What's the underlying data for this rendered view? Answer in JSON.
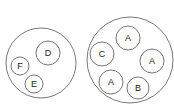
{
  "groups": [
    {
      "name": "left-group",
      "circle": {
        "cx": 41,
        "cy": 63,
        "r": 35
      },
      "items": [
        {
          "label": "D",
          "cx": 48,
          "cy": 53,
          "r": 12
        },
        {
          "label": "F",
          "cx": 20,
          "cy": 66,
          "r": 9
        },
        {
          "label": "E",
          "cx": 34,
          "cy": 84,
          "r": 9
        }
      ]
    },
    {
      "name": "right-group",
      "circle": {
        "cx": 130,
        "cy": 60,
        "r": 43
      },
      "items": [
        {
          "label": "A",
          "cx": 128,
          "cy": 38,
          "r": 12
        },
        {
          "label": "C",
          "cx": 102,
          "cy": 54,
          "r": 12
        },
        {
          "label": "A",
          "cx": 152,
          "cy": 61,
          "r": 12
        },
        {
          "label": "A",
          "cx": 111,
          "cy": 82,
          "r": 12
        },
        {
          "label": "B",
          "cx": 138,
          "cy": 88,
          "r": 11
        }
      ]
    }
  ]
}
